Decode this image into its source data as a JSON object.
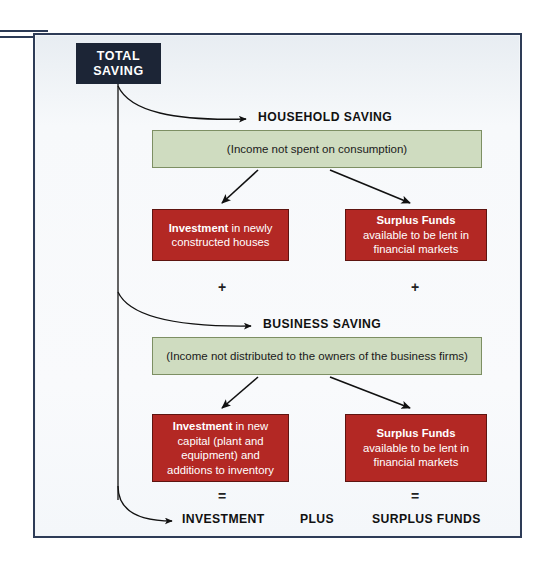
{
  "diagram": {
    "title": "Total Saving",
    "colors": {
      "frame_border": "#2e3c57",
      "panel_background": "#f3f6f9",
      "total_box": "#1c2536",
      "green_box": "#cfdcc0",
      "green_border": "#7d8f63",
      "red_box": "#b32824",
      "red_border": "#5e1410",
      "text_dark": "#111111",
      "text_light": "#ffffff"
    },
    "root": {
      "line1": "TOTAL",
      "line2": "SAVING"
    },
    "sections": [
      {
        "heading": "HOUSEHOLD SAVING",
        "definition": "(Income not spent on consumption)",
        "left_box": {
          "lead": "Investment",
          "rest": " in newly constructed houses"
        },
        "right_box": {
          "lead": "Surplus Funds",
          "rest": " available to be lent in financial markets"
        },
        "operator_left": "+",
        "operator_right": "+"
      },
      {
        "heading": "BUSINESS SAVING",
        "definition": "(Income not distributed to the owners of the business firms)",
        "left_box": {
          "lead": "Investment",
          "rest": " in new capital (plant and equipment) and additions to inventory"
        },
        "right_box": {
          "lead": "Surplus Funds",
          "rest": "available to be lent in financial markets"
        },
        "operator_left": "=",
        "operator_right": "="
      }
    ],
    "results": {
      "left": "INVESTMENT",
      "connector": "PLUS",
      "right": "SURPLUS FUNDS"
    }
  }
}
